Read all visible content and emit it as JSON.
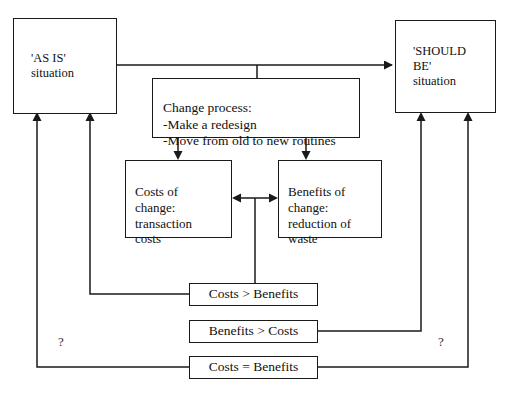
{
  "diagram": {
    "stroke_color": "#1a1a1a",
    "background_color": "#ffffff",
    "nodes": {
      "as_is": {
        "label": "'AS IS'\nsituation"
      },
      "should_be": {
        "label": "'SHOULD\nBE'\nsituation"
      },
      "change_process": {
        "label": "Change process:\n-Make a redesign\n-Move from old to new routines"
      },
      "costs_of_change": {
        "label": "Costs of\nchange:\ntransaction\ncosts"
      },
      "benefits_of_change": {
        "label": "Benefits of\nchange:\nreduction of\nwaste"
      },
      "costs_greater": {
        "label": "Costs > Benefits"
      },
      "benefits_greater": {
        "label": "Benefits > Costs"
      },
      "costs_equal": {
        "label": "Costs = Benefits"
      }
    },
    "annotations": {
      "question_left": "?",
      "question_right": "?"
    }
  }
}
